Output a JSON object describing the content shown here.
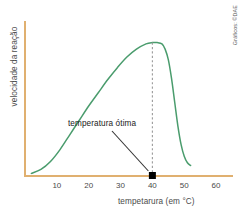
{
  "figure": {
    "credit": "Gráficos: ©DAE",
    "background_color": "#ffffff"
  },
  "colors": {
    "axis": "#e0b070",
    "curve": "#4a9c6d",
    "dashed_line": "#9a9a9a",
    "marker": "#000000",
    "leader_line": "#333333",
    "tick_text": "#4a4a4a",
    "annotation_text": "#1a1a1a"
  },
  "chart_data": {
    "type": "line",
    "title": "",
    "subtitle": "",
    "xlabel": "tempetarura (em °C)",
    "ylabel": "velocidade da reação",
    "xlim": [
      0,
      65
    ],
    "ylim": [
      0,
      1.12
    ],
    "grid": false,
    "legend": null,
    "xticks": [
      10,
      20,
      30,
      40,
      50,
      60
    ],
    "xtick_labels": [
      "10",
      "20",
      "30",
      "40",
      "50",
      "60"
    ],
    "yticks": [],
    "ytick_labels": [],
    "series": [
      {
        "name": "velocidade da reação",
        "color": "#4a9c6d",
        "x": [
          2,
          5,
          8,
          11,
          14,
          17,
          20,
          23,
          26,
          29,
          32,
          35,
          38,
          40,
          41.5,
          43,
          44,
          45,
          46,
          47,
          48,
          49,
          50,
          51,
          52
        ],
        "y": [
          0.02,
          0.05,
          0.11,
          0.2,
          0.31,
          0.42,
          0.53,
          0.63,
          0.73,
          0.82,
          0.9,
          0.96,
          1.0,
          1.01,
          1.01,
          1.0,
          0.96,
          0.88,
          0.74,
          0.56,
          0.38,
          0.24,
          0.15,
          0.1,
          0.08
        ]
      }
    ],
    "annotations": [
      {
        "text": "temperatura ótima",
        "x": 40,
        "y": 0,
        "marker": "square",
        "marker_color": "#000000",
        "line_style": "dashed",
        "line_from_y": 1.01,
        "line_to_y": 0
      }
    ]
  }
}
